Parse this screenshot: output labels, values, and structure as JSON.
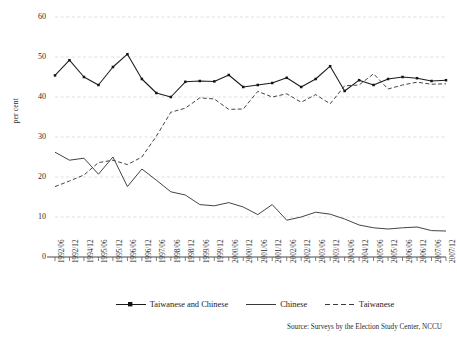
{
  "chart_data": {
    "type": "line",
    "title": "",
    "subtitle": "",
    "xlabel": "",
    "ylabel": "per cent",
    "ylim": [
      0,
      60
    ],
    "yticks": [
      0,
      10,
      20,
      30,
      40,
      50,
      60
    ],
    "grid": true,
    "legend_position": "bottom",
    "source_note": "Source: Surveys by the Election Study Center, NCCU",
    "categories": [
      "1992/06",
      "1992/12",
      "1994/12",
      "1995/06",
      "1995/12",
      "1996/06",
      "1996/12",
      "1997/06",
      "1998/06",
      "1998/12",
      "1999/06",
      "1999/12",
      "2000/06",
      "2000/12",
      "2001/06",
      "2001/12",
      "2002/06",
      "2002/12",
      "2003/06",
      "2003/12",
      "2004/06",
      "2004/12",
      "2005/06",
      "2005/12",
      "2006/06",
      "2006/12",
      "2007/06",
      "2007/12"
    ],
    "series": [
      {
        "name": "Taiwanese and Chinese",
        "style": "solid-markers",
        "values": [
          45.4,
          49.2,
          45.0,
          43.0,
          47.5,
          50.7,
          44.5,
          41.0,
          40.0,
          43.8,
          44.0,
          43.9,
          45.5,
          42.5,
          43.0,
          43.5,
          44.8,
          42.5,
          44.5,
          47.7,
          41.5,
          44.2,
          43.0,
          44.5,
          45.0,
          44.7,
          44.0,
          44.2
        ]
      },
      {
        "name": "Chinese",
        "style": "solid",
        "values": [
          26.2,
          24.2,
          24.7,
          20.7,
          25.0,
          17.6,
          22.0,
          19.2,
          16.3,
          15.5,
          13.1,
          12.8,
          13.6,
          12.5,
          10.6,
          13.1,
          9.2,
          10.0,
          11.2,
          10.7,
          9.5,
          8.0,
          7.3,
          7.0,
          7.3,
          7.5,
          6.6,
          6.5
        ]
      },
      {
        "name": "Taiwanese",
        "style": "dashed",
        "values": [
          17.6,
          19.0,
          20.5,
          23.6,
          24.2,
          23.1,
          25.0,
          30.2,
          36.2,
          37.2,
          39.8,
          39.5,
          36.9,
          37.0,
          41.4,
          40.0,
          40.8,
          38.7,
          40.6,
          38.3,
          42.8,
          43.0,
          45.8,
          42.0,
          43.0,
          43.7,
          43.2,
          43.3
        ]
      }
    ]
  },
  "legend": {
    "items": [
      {
        "label": "Taiwanese and Chinese",
        "glyph": "line-marker-glyph"
      },
      {
        "label": "Chinese",
        "glyph": "line-glyph"
      },
      {
        "label": "Taiwanese",
        "glyph": "dashed-line-glyph"
      }
    ]
  },
  "colors": {
    "series_tc": "#1b1b1b",
    "series_ch": "#3a3a3a",
    "series_tw": "#3a3a3a",
    "gridline": "#e3c9c9",
    "axis": "#4a4a4a",
    "background": "#ffffff"
  }
}
